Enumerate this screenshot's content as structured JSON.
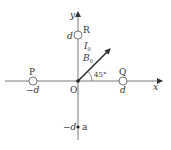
{
  "diagram": {
    "axes": {
      "x_label": "x",
      "y_label": "y",
      "origin_label": "O"
    },
    "points": {
      "R": {
        "label": "R",
        "coord_label": "d",
        "current_label": "I",
        "current_sub": "0"
      },
      "P": {
        "label": "P",
        "coord_label": "−d"
      },
      "Q": {
        "label": "Q",
        "coord_label": "d"
      },
      "a": {
        "label": "a",
        "coord_label": "−d"
      }
    },
    "field_vector": {
      "label": "B",
      "sub": "0",
      "angle_label": "45°"
    },
    "colors": {
      "stroke": "#333333",
      "axis": "#555555"
    }
  }
}
